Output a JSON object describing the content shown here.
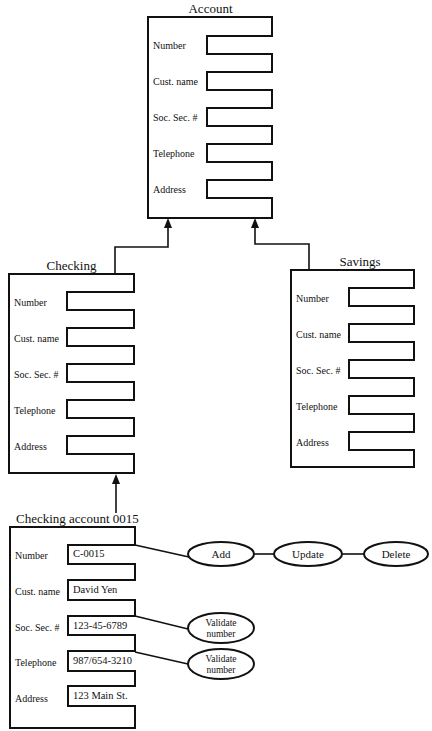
{
  "diagram": {
    "account": {
      "title": "Account",
      "fields": [
        "Number",
        "Cust. name",
        "Soc. Sec. #",
        "Telephone",
        "Address"
      ]
    },
    "checking": {
      "title": "Checking",
      "fields": [
        "Number",
        "Cust. name",
        "Soc. Sec. #",
        "Telephone",
        "Address"
      ]
    },
    "savings": {
      "title": "Savings",
      "fields": [
        "Number",
        "Cust. name",
        "Soc. Sec. #",
        "Telephone",
        "Address"
      ]
    },
    "instance": {
      "title": "Checking account 0015",
      "fields": [
        {
          "label": "Number",
          "value": "C-0015"
        },
        {
          "label": "Cust. name",
          "value": "David Yen"
        },
        {
          "label": "Soc. Sec. #",
          "value": "123-45-6789"
        },
        {
          "label": "Telephone",
          "value": "987/654-3210"
        },
        {
          "label": "Address",
          "value": "123 Main St."
        }
      ]
    },
    "operations": {
      "add": "Add",
      "update": "Update",
      "delete": "Delete",
      "validate_ssn": {
        "line1": "Validate",
        "line2": "number"
      },
      "validate_phone": {
        "line1": "Validate",
        "line2": "number"
      }
    },
    "colors": {
      "stroke": "#111111",
      "background": "#ffffff"
    }
  }
}
